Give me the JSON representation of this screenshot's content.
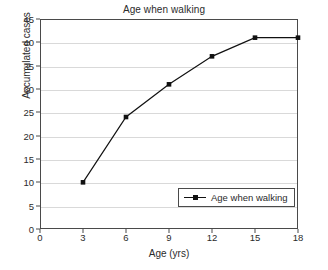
{
  "chart_data": {
    "type": "line",
    "title": "Age when walking",
    "xlabel": "Age (yrs)",
    "ylabel": "Accumulated cases",
    "x": [
      3,
      6,
      9,
      12,
      15,
      18
    ],
    "values": [
      10,
      24,
      31,
      37,
      41,
      41
    ],
    "series": [
      {
        "name": "Age when walking",
        "values": [
          10,
          24,
          31,
          37,
          41,
          41
        ]
      }
    ],
    "xlim": [
      0,
      18
    ],
    "ylim": [
      0,
      45
    ],
    "xticks": [
      "0",
      "3",
      "6",
      "9",
      "12",
      "15",
      "18"
    ],
    "yticks": [
      "0",
      "5",
      "10",
      "15",
      "20",
      "25",
      "30",
      "35",
      "40",
      "45"
    ],
    "xtick_values": [
      0,
      3,
      6,
      9,
      12,
      15,
      18
    ],
    "ytick_values": [
      0,
      5,
      10,
      15,
      20,
      25,
      30,
      35,
      40,
      45
    ],
    "grid": "horizontal",
    "legend_position": "lower-right",
    "legend_entries": [
      "Age when walking"
    ],
    "line_color": "#111111",
    "marker": "square",
    "marker_color": "#111111",
    "gridline_color": "#d9d9d9",
    "frame_color": "#4a4a4a",
    "background_color": "#ffffff"
  }
}
